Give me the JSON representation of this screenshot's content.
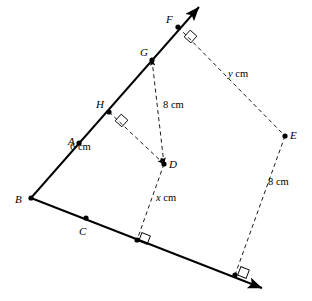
{
  "figure": {
    "stroke_color": "#000000",
    "dash_color": "#1a1a1a",
    "background": "#ffffff",
    "points": [
      {
        "id": "A",
        "label": "A",
        "x": 79,
        "y": 143,
        "dot": true,
        "label_x": 68,
        "label_y": 136
      },
      {
        "id": "B",
        "label": "B",
        "x": 31,
        "y": 198,
        "dot": true,
        "label_x": 15,
        "label_y": 194
      },
      {
        "id": "C",
        "label": "C",
        "x": 86,
        "y": 218,
        "dot": true,
        "label_x": 79,
        "label_y": 226
      },
      {
        "id": "D",
        "label": "D",
        "x": 164,
        "y": 164,
        "dot": true,
        "label_x": 169,
        "label_y": 159
      },
      {
        "id": "E",
        "label": "E",
        "x": 285,
        "y": 136,
        "dot": true,
        "label_x": 290,
        "label_y": 130
      },
      {
        "id": "F",
        "label": "F",
        "x": 178,
        "y": 27,
        "dot": true,
        "label_x": 166,
        "label_y": 14
      },
      {
        "id": "G",
        "label": "G",
        "x": 152,
        "y": 60,
        "dot": true,
        "label_x": 140,
        "label_y": 47
      },
      {
        "id": "H",
        "label": "H",
        "x": 109,
        "y": 112,
        "dot": true,
        "label_x": 96,
        "label_y": 99
      },
      {
        "id": "P1",
        "label": "",
        "x": 137,
        "y": 240,
        "dot": true,
        "label_x": 0,
        "label_y": 0
      },
      {
        "id": "P2",
        "label": "",
        "x": 235,
        "y": 275,
        "dot": true,
        "label_x": 0,
        "label_y": 0
      }
    ],
    "solid_segments": [
      {
        "name": "ray-B-to-F-arrow",
        "x1": 31,
        "y1": 198,
        "x2": 199,
        "y2": 7,
        "arrow_end": true
      },
      {
        "name": "ray-B-to-bottom-right-arrow",
        "x1": 31,
        "y1": 198,
        "x2": 262,
        "y2": 288,
        "arrow_end": true
      }
    ],
    "dashed_segments": [
      {
        "name": "segment-H-to-D",
        "x1": 109,
        "y1": 112,
        "x2": 164,
        "y2": 164,
        "arrow_end": true,
        "arrow_start": false
      },
      {
        "name": "segment-G-to-D",
        "x1": 152,
        "y1": 60,
        "x2": 164,
        "y2": 164,
        "arrow_end": true,
        "arrow_start": true
      },
      {
        "name": "segment-D-to-base-foot",
        "x1": 164,
        "y1": 164,
        "x2": 137,
        "y2": 240,
        "arrow_end": false,
        "arrow_start": false
      },
      {
        "name": "segment-F-to-E",
        "x1": 178,
        "y1": 27,
        "x2": 285,
        "y2": 136,
        "arrow_end": false,
        "arrow_start": false
      },
      {
        "name": "segment-E-to-base-foot",
        "x1": 285,
        "y1": 136,
        "x2": 235,
        "y2": 275,
        "arrow_end": false,
        "arrow_start": false
      }
    ],
    "right_angle_marks": [
      {
        "name": "right-angle-at-F",
        "x": 186,
        "y": 32,
        "size": 9,
        "rotate": -48
      },
      {
        "name": "right-angle-at-H",
        "x": 117,
        "y": 116,
        "size": 9,
        "rotate": -48
      },
      {
        "name": "right-angle-at-base-foot-D",
        "x": 140,
        "y": 234,
        "size": 9,
        "rotate": 21
      },
      {
        "name": "right-angle-at-base-foot-E",
        "x": 239,
        "y": 268,
        "size": 9,
        "rotate": 21
      }
    ],
    "length_labels": [
      {
        "name": "label-8cm-GD",
        "var": "",
        "text": "8 cm",
        "x": 163,
        "y": 100
      },
      {
        "name": "label-6cm-HD",
        "var": "",
        "text": "6 cm",
        "x": 70,
        "y": 142
      },
      {
        "name": "label-x-cm",
        "var": "x",
        "text": " cm",
        "x": 156,
        "y": 193
      },
      {
        "name": "label-y-cm",
        "var": "y",
        "text": " cm",
        "x": 228,
        "y": 69
      },
      {
        "name": "label-8cm-E",
        "var": "",
        "text": "8 cm",
        "x": 268,
        "y": 177
      }
    ]
  }
}
